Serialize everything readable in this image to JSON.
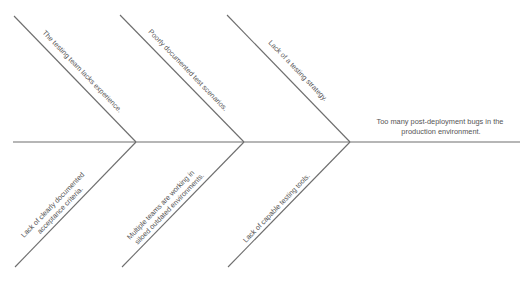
{
  "diagram": {
    "type": "fishbone",
    "effect": {
      "lines": [
        "Too many post-deployment bugs in the",
        "production environment."
      ]
    },
    "top_causes": [
      {
        "lines": [
          "The testing team lacks experience."
        ]
      },
      {
        "lines": [
          "Poorly documented test scenarios."
        ]
      },
      {
        "lines": [
          "Lack of a testing strategy."
        ]
      }
    ],
    "bottom_causes": [
      {
        "lines": [
          "Lack of clearly documented",
          "acceptance criteria."
        ]
      },
      {
        "lines": [
          "Multiple teams are working in",
          "siloed outdated environments."
        ]
      },
      {
        "lines": [
          "Lack of capable testing tools."
        ]
      }
    ],
    "colors": {
      "line": "#6e6e6e",
      "text": "#555555",
      "background": "#ffffff"
    }
  }
}
